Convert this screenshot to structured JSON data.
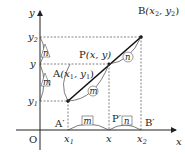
{
  "figure": {
    "axes": {
      "x_label": "x",
      "y_label": "y",
      "origin_label": "O"
    },
    "x_ticks": [
      {
        "base": "x",
        "sub": "1"
      },
      {
        "base": "x",
        "sub": ""
      },
      {
        "base": "x",
        "sub": "2"
      }
    ],
    "y_ticks": [
      {
        "base": "y",
        "sub": "2"
      },
      {
        "base": "y",
        "sub": ""
      },
      {
        "base": "y",
        "sub": "1"
      }
    ],
    "points": {
      "A": {
        "name": "A",
        "coords": "(x",
        "c1": "1",
        "mid": ", y",
        "c2": "1",
        "end": ")"
      },
      "P": {
        "name": "P",
        "coords": "(x, y)"
      },
      "B": {
        "name": "B",
        "coords": "(x",
        "c1": "2",
        "mid": ", y",
        "c2": "2",
        "end": ")"
      }
    },
    "projections": {
      "A_prime": "A′",
      "P_prime": "P′",
      "B_prime": "B′"
    },
    "ratio": {
      "m": "m",
      "n": "n"
    },
    "colors": {
      "line": "#111111",
      "dotted": "#666666",
      "axis": "#222222"
    }
  }
}
